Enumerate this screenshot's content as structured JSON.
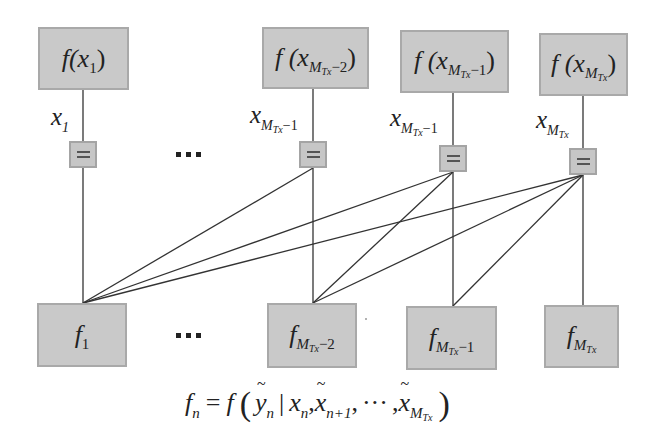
{
  "diagram": {
    "colors": {
      "box_fill": "#c9c9c9",
      "box_border": "#a9a9a9",
      "edge": "#333333",
      "background": "#ffffff"
    },
    "top_nodes": [
      {
        "id": "f_x1",
        "func": "f(x",
        "sub": "1",
        "close": ")"
      },
      {
        "id": "f_xMTx-2",
        "func": "f (x",
        "sub_main": "M",
        "sub_sub": "Tx",
        "sub_tail": "−2",
        "close": ")"
      },
      {
        "id": "f_xMTx-1",
        "func": "f (x",
        "sub_main": "M",
        "sub_sub": "Tx",
        "sub_tail": "−1",
        "close": ")"
      },
      {
        "id": "f_xMTx",
        "func": "f (x",
        "sub_main": "M",
        "sub_sub": "Tx",
        "sub_tail": "",
        "close": ")"
      }
    ],
    "variable_labels": [
      {
        "base": "x",
        "sub": "1"
      },
      {
        "base": "x",
        "sub_main": "M",
        "sub_sub": "Tx",
        "sub_tail": "−1"
      },
      {
        "base": "x",
        "sub_main": "M",
        "sub_sub": "Tx",
        "sub_tail": "−1"
      },
      {
        "base": "x",
        "sub_main": "M",
        "sub_sub": "Tx",
        "sub_tail": ""
      }
    ],
    "equality_node_symbol": "=",
    "bottom_nodes": [
      {
        "id": "f_1",
        "base": "f",
        "sub": "1"
      },
      {
        "id": "f_MTx-2",
        "base": "f",
        "sub_main": "M",
        "sub_sub": "Tx",
        "sub_tail": "−2"
      },
      {
        "id": "f_MTx-1",
        "base": "f",
        "sub_main": "M",
        "sub_sub": "Tx",
        "sub_tail": "−1"
      },
      {
        "id": "f_MTx",
        "base": "f",
        "sub_main": "M",
        "sub_sub": "Tx",
        "sub_tail": ""
      }
    ],
    "ellipsis": "…",
    "edges": [
      {
        "from": "eq_1",
        "to": "f_1"
      },
      {
        "from": "eq_2",
        "to": "f_MTx-2"
      },
      {
        "from": "eq_3",
        "to": "f_MTx-1"
      },
      {
        "from": "eq_4",
        "to": "f_MTx"
      },
      {
        "from": "eq_2",
        "to": "f_1"
      },
      {
        "from": "eq_3",
        "to": "f_1"
      },
      {
        "from": "eq_4",
        "to": "f_1"
      },
      {
        "from": "eq_3",
        "to": "f_MTx-2"
      },
      {
        "from": "eq_4",
        "to": "f_MTx-2"
      },
      {
        "from": "eq_4",
        "to": "f_MTx-1"
      }
    ],
    "formula": {
      "lhs_base": "f",
      "lhs_sub": "n",
      "equals": "=",
      "func": "f",
      "open": "(",
      "y": "y",
      "y_sub": "n",
      "bar": "|",
      "x": "x",
      "x_sub": "n",
      "comma": ",",
      "xt": "x",
      "xt_sub": "n+1",
      "dots": "···",
      "xt2": "x",
      "xt2_sub_main": "M",
      "xt2_sub_sub": "Tx",
      "close": ")"
    }
  }
}
